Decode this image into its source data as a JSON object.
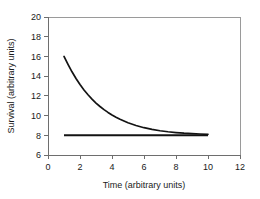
{
  "chart_data": {
    "type": "line",
    "title": "",
    "xlabel": "Time (arbitrary units)",
    "ylabel": "Survival (arbitrary units)",
    "xlim": [
      0,
      12
    ],
    "ylim": [
      6,
      20
    ],
    "xticks": [
      0,
      2,
      4,
      6,
      8,
      10,
      12
    ],
    "yticks": [
      6,
      8,
      10,
      12,
      14,
      16,
      18,
      20
    ],
    "grid": false,
    "legend": false,
    "series": [
      {
        "name": "exponential-decay",
        "color": "#131313",
        "x": [
          1.0,
          1.25,
          1.5,
          1.75,
          2.0,
          2.25,
          2.5,
          2.75,
          3.0,
          3.25,
          3.5,
          3.75,
          4.0,
          4.25,
          4.5,
          4.75,
          5.0,
          5.5,
          6.0,
          6.5,
          7.0,
          7.5,
          8.0,
          8.5,
          9.0,
          9.5,
          10.0
        ],
        "values": [
          16.0,
          15.2,
          14.44,
          13.76,
          13.15,
          12.6,
          12.11,
          11.67,
          11.27,
          10.92,
          10.6,
          10.32,
          10.06,
          9.83,
          9.62,
          9.44,
          9.27,
          8.99,
          8.77,
          8.6,
          8.46,
          8.36,
          8.28,
          8.21,
          8.17,
          8.13,
          8.1
        ]
      },
      {
        "name": "baseline-asymptote",
        "color": "#131313",
        "x": [
          1.0,
          10.0
        ],
        "values": [
          8.0,
          8.0
        ]
      }
    ]
  },
  "axes": {
    "x_tick_labels": [
      "0",
      "2",
      "4",
      "6",
      "8",
      "10",
      "12"
    ],
    "y_tick_labels": [
      "6",
      "8",
      "10",
      "12",
      "14",
      "16",
      "18",
      "20"
    ],
    "x_axis_title": "Time (arbitrary units)",
    "y_axis_title": "Survival (arbitrary units)"
  },
  "colors": {
    "curve": "#131313",
    "frame": "#9a9a9a",
    "axis": "#6e6e6e",
    "text": "#1a1a1a",
    "background": "#ffffff"
  }
}
